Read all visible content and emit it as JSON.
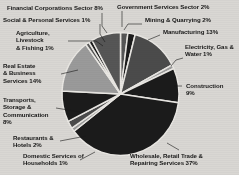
{
  "background_color": "#d9d7d3",
  "chart_data": {
    "type": "pie",
    "title": "",
    "subtitle": "",
    "xlabel": "",
    "ylabel": "",
    "legend_position": "none",
    "grid": false,
    "total_percent": 99,
    "start_angle_deg": 0,
    "direction": "clockwise",
    "categories": [
      "Government Services Sector",
      "Mining & Quarrying",
      "Manufacturing",
      "Electricity, Gas & Water",
      "Construction",
      "Wholesale, Retail Trade & Repairing Services",
      "Domestic Services of Households",
      "Restaurants & Hotels",
      "Transports, Storage & Communication",
      "Real Estate & Business Services",
      "Agriculture, Livestock & Fishing",
      "Social & Personal Services",
      "Financial Corporations Sector"
    ],
    "values": [
      2,
      2,
      13,
      1,
      9,
      37,
      1,
      2,
      8,
      14,
      1,
      1,
      8
    ],
    "value_suffix": "%",
    "colors": [
      "#565656",
      "#1b1b1b",
      "#4b4b4b",
      "#9a9a9a",
      "#1b1b1b",
      "#1b1b1b",
      "#9a9a9a",
      "#4b4b4b",
      "#1b1b1b",
      "#9a9a9a",
      "#565656",
      "#1b1b1b",
      "#565656"
    ],
    "slice_border_color": "#e9e7e3"
  },
  "labels": {
    "financial_corporations": "Financial Corporations Sector  8%",
    "social_personal": "Social & Personal Services  1%",
    "agriculture": "Agriculture,\nLivestock\n& Fishing 1%",
    "real_estate": "Real Estate\n& Business\nServices  14%",
    "transports": "Transports,\nStorage &\nCommunication\n8%",
    "restaurants": "Restaurants &\nHotels  2%",
    "domestic_services": "Domestic Services of\nHouseholds 1%",
    "government_services": "Government Services Sector  2%",
    "mining_quarrying": "Mining & Quarrying  2%",
    "manufacturing": "Manufacturing  13%",
    "electricity": "Electricity, Gas &\nWater  1%",
    "construction": "Construction\n9%",
    "wholesale_retail": "Wholesale, Retail Trade &\nRepairing Services  37%"
  }
}
